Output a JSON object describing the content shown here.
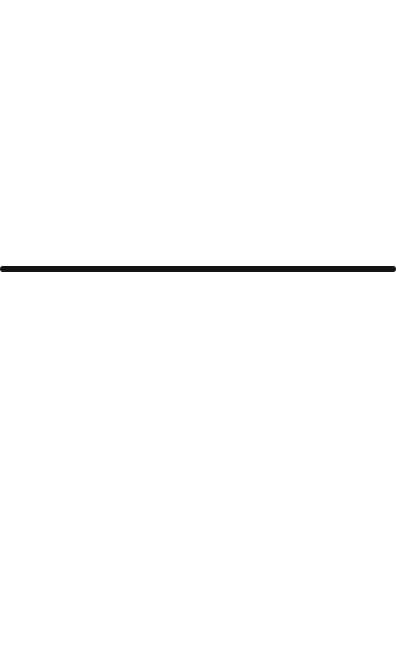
{
  "canvas": {
    "background_color": "#ffffff",
    "width": 396,
    "height": 650
  },
  "divider": {
    "orientation": "horizontal",
    "color": "#141414",
    "thickness_px": 6,
    "y_px": 266
  }
}
